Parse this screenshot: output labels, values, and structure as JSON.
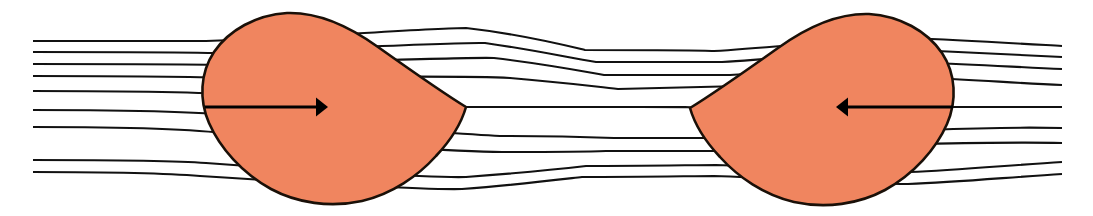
{
  "figure": {
    "name": "two-bodies-in-streamline-flow",
    "title": "Two teardrop bodies approaching each other in a streamline flow field",
    "width": 1093,
    "height": 216,
    "background_color": "#ffffff"
  },
  "style": {
    "body_fill_color": "#F0855F",
    "body_stroke_color": "#1a1008",
    "body_stroke_width": 2.6,
    "streamline_color": "#111111",
    "streamline_width": 2.1,
    "arrow_color": "#000000",
    "arrow_shaft_width": 3.2
  },
  "bodies": [
    {
      "id": "left-body",
      "label": "left teardrop body",
      "orientation": "apex-right",
      "bounds": {
        "x_min": 203,
        "x_max": 466,
        "y_min": 13,
        "y_max": 204
      },
      "apex": {
        "x": 466,
        "y": 107
      },
      "fill": "#F0855F",
      "path": "M 466 107 C 462 121 452 139 436 156 C 418 176 392 194 362 201 C 330 208 297 203 271 189 C 242 173 220 148 209 123 C 199 100 200 73 214 52 C 229 30 256 15 287 13 C 318 12 349 26 378 47 C 409 69 443 93 466 107 Z"
    },
    {
      "id": "right-body",
      "label": "right teardrop body",
      "orientation": "apex-left",
      "bounds": {
        "x_min": 690,
        "x_max": 955,
        "y_min": 13,
        "y_max": 204
      },
      "apex": {
        "x": 690,
        "y": 108
      },
      "fill": "#F0855F",
      "path": "M 690 108 C 694 122 704 140 720 157 C 738 177 764 195 794 202 C 826 209 859 204 885 190 C 914 174 936 149 947 124 C 957 101 956 74 942 53 C 927 31 900 16 869 14 C 838 13 807 27 778 48 C 747 70 713 94 690 108 Z"
    }
  ],
  "arrows": [
    {
      "id": "left-arrow",
      "label": "left body velocity arrow",
      "direction": "right",
      "shaft": {
        "x1": 205,
        "y1": 107,
        "x2": 316,
        "y2": 107
      },
      "head_tip": {
        "x": 328,
        "y": 107
      },
      "color": "#000000"
    },
    {
      "id": "right-arrow",
      "label": "right body velocity arrow",
      "direction": "left",
      "shaft": {
        "x1": 953,
        "y1": 107,
        "x2": 848,
        "y2": 107
      },
      "head_tip": {
        "x": 836,
        "y": 107
      },
      "color": "#000000"
    }
  ],
  "streamlines": {
    "count": 9,
    "label": "flow streamlines",
    "inlet_x": 33,
    "outlet_x": 1062,
    "left_inlet_y": [
      41,
      52,
      64,
      76,
      91,
      110,
      127,
      160,
      172
    ],
    "mid_gap_y": [
      50,
      62,
      75,
      107,
      138,
      151,
      165
    ],
    "right_outlet_y": [
      46,
      57,
      69,
      85,
      107,
      128,
      143,
      162,
      174
    ],
    "paths": [
      "M 33 41 C 120 41 180 41 206 41 C 300 38 430 28 466 28 C 520 34 560 44 585 50 C 640 50 700 50 714 51 C 780 47 860 38 910 38 C 960 40 1010 43 1062 46",
      "M 33 52 C 120 52 185 52 212 53 C 310 50 448 42 485 43 C 535 50 570 58 596 62 C 650 62 705 62 722 62 C 790 58 868 50 916 50 C 965 52 1012 55 1062 57",
      "M 33 64 C 125 64 195 64 222 65 C 320 63 455 57 494 58 C 545 64 576 70 604 75 C 655 75 710 75 730 75 C 798 70 876 63 924 63 C 972 64 1014 67 1062 69",
      "M 33 76 C 130 76 205 77 234 78 C 330 77 462 75 510 78 C 560 82 590 86 618 89 C 668 88 714 87 742 86 C 810 82 884 78 930 78 C 978 80 1016 83 1062 85",
      "M 33 91 C 140 91 215 93 245 95 C 345 99 455 104 466 107 C 520 107 580 107 640 107 C 700 107 690 107 690 108 C 730 110 820 107 880 107 C 940 107 1006 107 1062 107",
      "M 33 110 C 140 110 218 113 248 117 C 348 125 458 134 500 136 C 552 136 586 137 614 138 C 666 138 712 138 740 138 C 808 136 882 132 928 130 C 976 128 1016 127 1062 128",
      "M 33 127 C 130 127 202 130 230 134 C 330 143 460 152 502 152 C 550 152 580 152 606 151 C 656 151 706 151 726 151 C 794 150 874 146 920 144 C 968 143 1014 142 1062 143",
      "M 33 160 C 120 160 180 161 206 163 C 300 170 430 178 466 177 C 520 173 560 169 586 166 C 640 166 700 165 716 165 C 782 167 862 172 910 172 C 958 170 1012 165 1062 162",
      "M 33 172 C 118 172 176 174 200 176 C 292 182 424 190 462 189 C 516 185 556 180 582 177 C 638 177 698 176 714 176 C 780 178 860 184 908 184 C 958 182 1012 177 1062 174"
    ]
  }
}
